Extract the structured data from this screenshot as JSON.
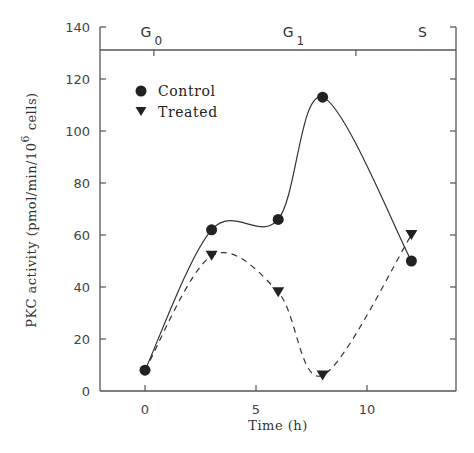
{
  "chart_data": {
    "type": "line",
    "title": "",
    "xlabel": "Time (h)",
    "ylabel": "PKC activity (pmol/min/10^6 cells)",
    "ylabel_parts": {
      "main": "PKC activity (pmol/min/10",
      "sup": "6",
      "tail": " cells)"
    },
    "xlim": [
      -2,
      14
    ],
    "ylim": [
      0,
      140
    ],
    "xticks": [
      0,
      5,
      10
    ],
    "yticks": [
      0,
      20,
      40,
      60,
      80,
      100,
      120,
      140
    ],
    "grid": false,
    "legend_position": "upper left",
    "phases": [
      {
        "label": "G",
        "sub": "0",
        "x": -0.2
      },
      {
        "label": "G",
        "sub": "1",
        "x": 6.2
      },
      {
        "label": "S",
        "sub": "",
        "x": 12.3
      }
    ],
    "phase_boundaries": [
      0.4,
      9.5
    ],
    "series": [
      {
        "name": "Control",
        "marker": "circle",
        "line": "solid",
        "x": [
          0,
          3,
          6,
          8,
          12
        ],
        "values": [
          8,
          62,
          66,
          113,
          50
        ]
      },
      {
        "name": "Treated",
        "marker": "triangle-down",
        "line": "dashed",
        "x": [
          0,
          3,
          6,
          8,
          12
        ],
        "values": [
          8,
          52,
          38,
          6,
          60
        ]
      }
    ]
  },
  "colors": {
    "ink": "#222222",
    "axis": "#555555",
    "background": "#ffffff"
  }
}
